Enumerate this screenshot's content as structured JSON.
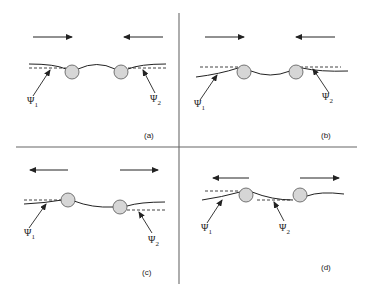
{
  "figure": {
    "colors": {
      "line": "#222222",
      "particle_fill": "#d6d6d6",
      "particle_stroke": "#555555",
      "divider": "#777777",
      "dashed": "#444444"
    },
    "panels": [
      {
        "id": "a",
        "label": "(a)",
        "psi1": "Ψ",
        "psi1_sub": "1",
        "psi2": "Ψ",
        "psi2_sub": "2",
        "arrows": "toward each other (attraction)"
      },
      {
        "id": "b",
        "label": "(b)",
        "psi1": "Ψ",
        "psi1_sub": "1",
        "psi2": "Ψ",
        "psi2_sub": "2",
        "arrows": "toward each other (attraction)"
      },
      {
        "id": "c",
        "label": "(c)",
        "psi1": "Ψ",
        "psi1_sub": "1",
        "psi2": "Ψ",
        "psi2_sub": "2",
        "arrows": "away from each other (repulsion)"
      },
      {
        "id": "d",
        "label": "(d)",
        "psi1": "Ψ",
        "psi1_sub": "1",
        "psi2": "Ψ",
        "psi2_sub": "2",
        "arrows": "away from each other (repulsion)"
      }
    ]
  }
}
